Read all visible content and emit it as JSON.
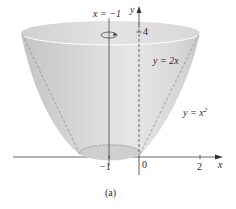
{
  "figure": {
    "caption": "(a)",
    "labels": {
      "axis_line_label": "x = −1",
      "y_axis": "y",
      "x_axis": "x",
      "y_tick_4": "4",
      "line_label": "y = 2x",
      "curve_label_base": "y = x",
      "curve_label_exp": "2"
    },
    "x_ticks": [
      "−1",
      "0",
      "2"
    ],
    "colors": {
      "surface_light": "#ececec",
      "surface_mid": "#d6d6d6",
      "surface_dark": "#bdbdbd",
      "axis": "#333333"
    }
  }
}
